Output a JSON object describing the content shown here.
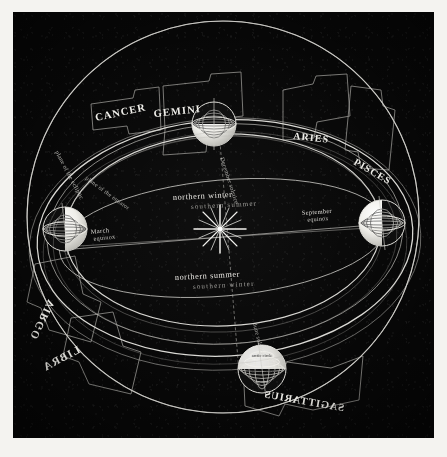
{
  "figure": {
    "medium": "engraved plate on paper",
    "plate_background": "#070707",
    "ink_color": "#e8e7e2",
    "paper_color": "#f4f3f0",
    "caption": ""
  },
  "sun": {
    "label": "sun",
    "icon": "sunburst-star-icon",
    "x": 220,
    "y": 229
  },
  "earth_positions": [
    {
      "id": "december-solstice",
      "season_label_primary": "northern winter",
      "season_label_secondary": "southern summer",
      "axis_label": "December solstice",
      "lit_side": "bottom",
      "x": 214,
      "y": 124
    },
    {
      "id": "march-equinox",
      "season_label_primary": "March",
      "season_label_secondary": "equinox",
      "axis_label": "March equinox",
      "lit_side": "right",
      "x": 65,
      "y": 229
    },
    {
      "id": "june-solstice",
      "season_label_primary": "northern summer",
      "season_label_secondary": "southern winter",
      "axis_label": "June solstice",
      "lit_side": "top",
      "x": 260,
      "y": 370
    },
    {
      "id": "september-equinox",
      "season_label_primary": "September",
      "season_label_secondary": "equinox",
      "axis_label": "September equinox",
      "lit_side": "left",
      "x": 380,
      "y": 223
    }
  ],
  "season_labels": {
    "upper_primary": "northern winter",
    "upper_secondary": "southern summer",
    "lower_primary": "northern summer",
    "lower_secondary": "southern winter"
  },
  "equinox_labels": {
    "march_line1": "March",
    "march_line2": "equinox",
    "september_line1": "September",
    "september_line2": "equinox"
  },
  "solstice_labels": {
    "december": "December solstice",
    "june": "June solstice"
  },
  "plane_labels": {
    "ecliptic": "plane of the ecliptic",
    "equator": "plane of the equator"
  },
  "globe_detail_labels": [
    "arctic circle",
    "tropic of cancer",
    "equator"
  ],
  "zodiac": [
    {
      "name": "CANCER",
      "mirrored": false,
      "x": 108,
      "y": 115,
      "rot": -12
    },
    {
      "name": "GEMINI",
      "mirrored": false,
      "x": 168,
      "y": 110,
      "rot": -6
    },
    {
      "name": "ARIES",
      "mirrored": false,
      "x": 314,
      "y": 127,
      "rot": 6
    },
    {
      "name": "PISCES",
      "mirrored": false,
      "x": 374,
      "y": 160,
      "rot": 28
    },
    {
      "name": "VIRGO",
      "mirrored": true,
      "x": 54,
      "y": 300,
      "rot": -62
    },
    {
      "name": "LIBRA",
      "mirrored": true,
      "x": 82,
      "y": 345,
      "rot": -28
    },
    {
      "name": "SAGITTARIUS",
      "mirrored": true,
      "x": 300,
      "y": 390,
      "rot": 10
    }
  ],
  "structures": {
    "celestial_sphere": "outer great circle of the celestial sphere",
    "ecliptic_band": "zodiacal band along the ecliptic",
    "equator_ring": "celestial equator ring",
    "earth_orbit": "ellipse of the Earth's orbit"
  }
}
